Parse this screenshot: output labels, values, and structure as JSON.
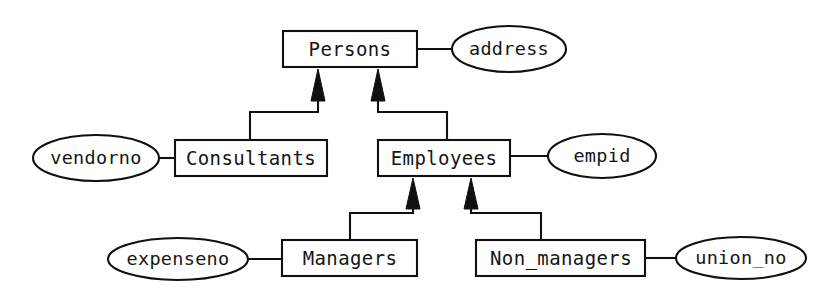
{
  "diagram": {
    "style": {
      "line_color": "#101010",
      "fill_color": "#ffffff",
      "text_color": "#151515",
      "background": "#ffffff"
    },
    "entities": [
      {
        "id": "persons",
        "label": "Persons",
        "x": 283,
        "y": 31,
        "w": 134,
        "h": 36
      },
      {
        "id": "consultants",
        "label": "Consultants",
        "x": 175,
        "y": 140,
        "w": 152,
        "h": 36
      },
      {
        "id": "employees",
        "label": "Employees",
        "x": 378,
        "y": 140,
        "w": 132,
        "h": 36
      },
      {
        "id": "managers",
        "label": "Managers",
        "x": 282,
        "y": 240,
        "w": 135,
        "h": 36
      },
      {
        "id": "non_managers",
        "label": "Non_managers",
        "x": 476,
        "y": 240,
        "w": 169,
        "h": 36
      }
    ],
    "attributes": [
      {
        "id": "address",
        "label": "address",
        "cx": 509,
        "cy": 49,
        "rx": 57,
        "ry": 23,
        "owner": "persons"
      },
      {
        "id": "vendorno",
        "label": "vendorno",
        "cx": 96,
        "cy": 158,
        "rx": 63,
        "ry": 23,
        "owner": "consultants"
      },
      {
        "id": "empid",
        "label": "empid",
        "cx": 602,
        "cy": 156,
        "rx": 54,
        "ry": 22,
        "owner": "employees"
      },
      {
        "id": "expenseno",
        "label": "expenseno",
        "cx": 178,
        "cy": 259,
        "rx": 70,
        "ry": 21,
        "owner": "managers"
      },
      {
        "id": "union_no",
        "label": "union_no",
        "cx": 741,
        "cy": 258,
        "rx": 65,
        "ry": 21,
        "owner": "non_managers"
      }
    ],
    "isa_relationships": [
      {
        "id": "consultants-isa-persons",
        "child": "consultants",
        "parent": "persons",
        "arrow_x": 318
      },
      {
        "id": "employees-isa-persons",
        "child": "employees",
        "parent": "persons",
        "arrow_x": 378
      },
      {
        "id": "managers-isa-employees",
        "child": "managers",
        "parent": "employees",
        "arrow_x": 413
      },
      {
        "id": "non_managers-isa-employees",
        "child": "non_managers",
        "parent": "employees",
        "arrow_x": 471
      }
    ],
    "attribute_links": [
      {
        "id": "persons-address-link",
        "from": "persons",
        "to": "address"
      },
      {
        "id": "consultants-vendorno-link",
        "from": "consultants",
        "to": "vendorno"
      },
      {
        "id": "employees-empid-link",
        "from": "employees",
        "to": "empid"
      },
      {
        "id": "managers-expenseno-link",
        "from": "managers",
        "to": "expenseno"
      },
      {
        "id": "non_managers-union_no-link",
        "from": "non_managers",
        "to": "union_no"
      }
    ]
  }
}
